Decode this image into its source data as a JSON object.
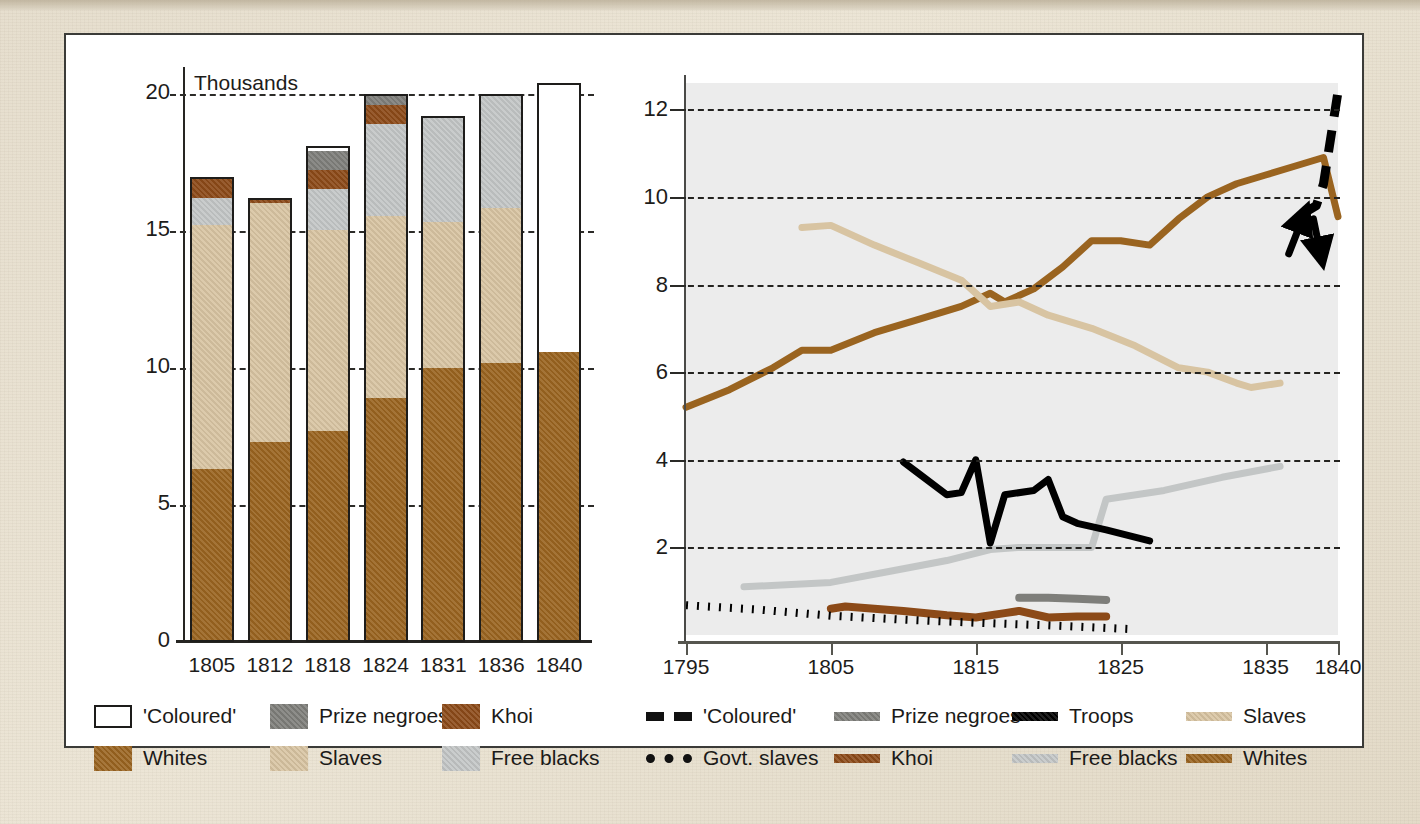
{
  "colors": {
    "coloured": "#ffffff",
    "prize_negroes": "#7e7e7a",
    "khoi": "#8c4a18",
    "whites": "#9a6420",
    "slaves": "#d8c4a2",
    "free_blacks": "#c3c6c6",
    "troops": "#000000",
    "govt_slaves": "#000000",
    "plot_bg": "#ececec",
    "paper_bg": "#e6ddcc",
    "axis": "#262522"
  },
  "bar_chart": {
    "unit_label": "Thousands",
    "yticks": [
      0,
      5,
      10,
      15,
      20
    ],
    "ylim": [
      0,
      21
    ],
    "categories": [
      "1805",
      "1812",
      "1818",
      "1824",
      "1831",
      "1836",
      "1840"
    ],
    "series_order": [
      "Whites",
      "Slaves",
      "Free blacks",
      "Khoi",
      "Prize negroes",
      "'Coloured'"
    ],
    "legend": [
      {
        "label": "'Coloured'",
        "swatch": "coloured"
      },
      {
        "label": "Prize negroes",
        "swatch": "prize_negroes"
      },
      {
        "label": "Khoi",
        "swatch": "khoi"
      },
      {
        "label": "Whites",
        "swatch": "whites"
      },
      {
        "label": "Slaves",
        "swatch": "slaves"
      },
      {
        "label": "Free blacks",
        "swatch": "free_blacks"
      }
    ]
  },
  "line_chart": {
    "yticks": [
      2,
      4,
      6,
      8,
      10,
      12
    ],
    "ylim": [
      0,
      12.6
    ],
    "xticks": [
      "1795",
      "1805",
      "1815",
      "1825",
      "1835",
      "1840"
    ],
    "xlim": [
      1795,
      1840
    ],
    "legend": [
      {
        "label": "'Coloured'",
        "style": "dash",
        "color": "govt_slaves"
      },
      {
        "label": "Prize negroes",
        "style": "solid",
        "color": "prize_negroes"
      },
      {
        "label": "Troops",
        "style": "solid",
        "color": "troops"
      },
      {
        "label": "Slaves",
        "style": "solid",
        "color": "slaves"
      },
      {
        "label": "Govt. slaves",
        "style": "dot",
        "color": "govt_slaves"
      },
      {
        "label": "Khoi",
        "style": "solid",
        "color": "khoi"
      },
      {
        "label": "Free blacks",
        "style": "solid",
        "color": "free_blacks"
      },
      {
        "label": "Whites",
        "style": "solid",
        "color": "whites"
      }
    ]
  },
  "chart_data": [
    {
      "type": "bar",
      "title": "",
      "subtitle": "Thousands",
      "xlabel": "",
      "ylabel": "Thousands",
      "ylim": [
        0,
        21
      ],
      "yticks": [
        0,
        5,
        10,
        15,
        20
      ],
      "grid": true,
      "stacked": true,
      "legend_position": "below",
      "categories": [
        "1805",
        "1812",
        "1818",
        "1824",
        "1831",
        "1836",
        "1840"
      ],
      "series": [
        {
          "name": "Whites",
          "values": [
            6.3,
            7.3,
            7.7,
            8.9,
            10.0,
            10.2,
            10.6
          ]
        },
        {
          "name": "Slaves",
          "values": [
            9.0,
            8.8,
            7.4,
            6.7,
            5.4,
            5.7,
            0
          ]
        },
        {
          "name": "Free blacks",
          "values": [
            1.0,
            0,
            1.5,
            3.4,
            3.8,
            4.1,
            0
          ]
        },
        {
          "name": "Khoi",
          "values": [
            0.7,
            0.1,
            0.7,
            0.7,
            0,
            0,
            0
          ]
        },
        {
          "name": "Prize negroes",
          "values": [
            0,
            0,
            0.7,
            0.3,
            0,
            0,
            0
          ]
        },
        {
          "name": "'Coloured'",
          "values": [
            0,
            0,
            0,
            0,
            0,
            0,
            9.8
          ]
        }
      ],
      "totals": [
        17.0,
        16.2,
        18.1,
        20.0,
        19.2,
        20.0,
        20.4
      ]
    },
    {
      "type": "line",
      "title": "",
      "xlabel": "",
      "ylabel": "",
      "xlim": [
        1795,
        1840
      ],
      "ylim": [
        0,
        12.6
      ],
      "xticks": [
        1795,
        1805,
        1815,
        1825,
        1835,
        1840
      ],
      "yticks": [
        2,
        4,
        6,
        8,
        10,
        12
      ],
      "grid": true,
      "legend_position": "below",
      "series": [
        {
          "name": "Whites",
          "style": "solid",
          "x": [
            1795,
            1798,
            1801,
            1803,
            1805,
            1808,
            1811,
            1814,
            1816,
            1817,
            1819,
            1821,
            1823,
            1825,
            1827,
            1829,
            1831,
            1833,
            1835,
            1837,
            1839,
            1840
          ],
          "values": [
            5.2,
            5.6,
            6.1,
            6.5,
            6.5,
            6.9,
            7.2,
            7.5,
            7.8,
            7.6,
            7.9,
            8.4,
            9.0,
            9.0,
            8.9,
            9.5,
            10.0,
            10.3,
            10.5,
            10.7,
            10.9,
            9.55
          ]
        },
        {
          "name": "Slaves",
          "style": "solid",
          "x": [
            1803,
            1805,
            1808,
            1811,
            1814,
            1816,
            1818,
            1820,
            1823,
            1826,
            1829,
            1831,
            1833,
            1834,
            1836
          ],
          "values": [
            9.3,
            9.35,
            8.9,
            8.5,
            8.1,
            7.5,
            7.6,
            7.3,
            7.0,
            6.6,
            6.1,
            6.0,
            5.75,
            5.65,
            5.75
          ]
        },
        {
          "name": "Free blacks",
          "style": "solid",
          "x": [
            1799,
            1805,
            1809,
            1813,
            1816,
            1818,
            1821,
            1823,
            1824,
            1828,
            1832,
            1836
          ],
          "values": [
            1.1,
            1.2,
            1.45,
            1.7,
            1.95,
            2.0,
            2.0,
            2.0,
            3.1,
            3.3,
            3.6,
            3.85
          ]
        },
        {
          "name": "Troops",
          "style": "solid",
          "x": [
            1810,
            1811,
            1813,
            1814,
            1815,
            1816,
            1817,
            1819,
            1820,
            1821,
            1822,
            1824,
            1827
          ],
          "values": [
            3.95,
            3.7,
            3.2,
            3.25,
            4.0,
            2.1,
            3.2,
            3.3,
            3.55,
            2.7,
            2.55,
            2.4,
            2.15
          ]
        },
        {
          "name": "Khoi",
          "style": "solid",
          "x": [
            1805,
            1806,
            1810,
            1813,
            1815,
            1817,
            1818,
            1820,
            1822,
            1824
          ],
          "values": [
            0.6,
            0.65,
            0.55,
            0.45,
            0.4,
            0.5,
            0.55,
            0.4,
            0.42,
            0.42
          ]
        },
        {
          "name": "Govt. slaves",
          "style": "dotted",
          "x": [
            1795,
            1800,
            1805,
            1810,
            1815,
            1820,
            1824,
            1826
          ],
          "values": [
            0.68,
            0.58,
            0.44,
            0.35,
            0.28,
            0.22,
            0.16,
            0.13
          ]
        },
        {
          "name": "Prize negroes",
          "style": "solid",
          "x": [
            1818,
            1820,
            1822,
            1824
          ],
          "values": [
            0.85,
            0.85,
            0.83,
            0.8
          ]
        },
        {
          "name": "'Coloured'",
          "style": "dashed",
          "x": [
            1837.5,
            1838.5,
            1839,
            1840
          ],
          "values": [
            9.6,
            9.8,
            10.3,
            12.4
          ]
        }
      ],
      "annotations": [
        {
          "type": "arrow",
          "note": "arrow pointing up at 'Coloured' line near 1838"
        },
        {
          "type": "arrow",
          "note": "arrow pointing down-right at Whites line near 1839"
        }
      ]
    }
  ]
}
